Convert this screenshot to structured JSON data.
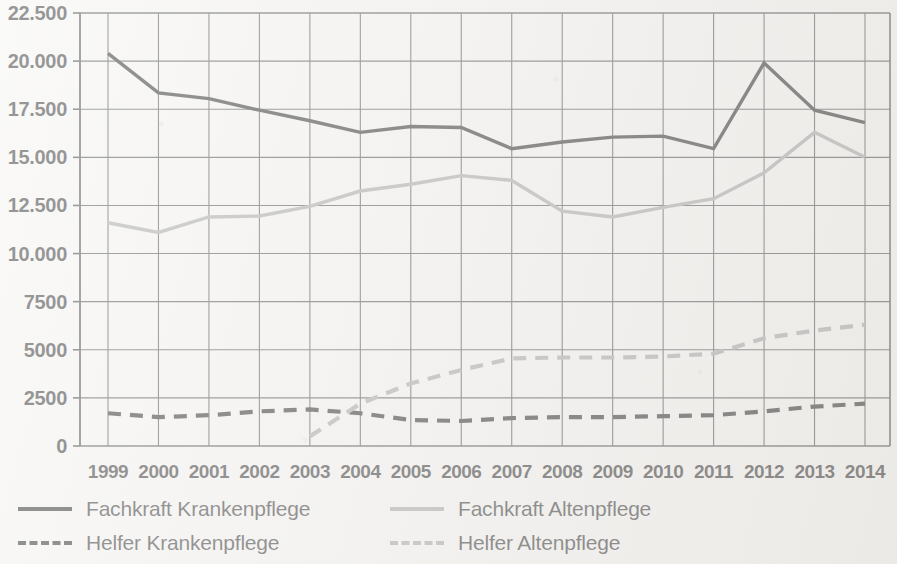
{
  "chart_data": {
    "type": "line",
    "title": "",
    "subtitle": "",
    "xlabel": "",
    "ylabel": "",
    "categories": [
      "1999",
      "2000",
      "2001",
      "2002",
      "2003",
      "2004",
      "2005",
      "2006",
      "2007",
      "2008",
      "2009",
      "2010",
      "2011",
      "2012",
      "2013",
      "2014"
    ],
    "x": [
      1999,
      2000,
      2001,
      2002,
      2003,
      2004,
      2005,
      2006,
      2007,
      2008,
      2009,
      2010,
      2011,
      2012,
      2013,
      2014
    ],
    "ylim": [
      0,
      22500
    ],
    "yticks": [
      0,
      2500,
      5000,
      7500,
      10000,
      12500,
      15000,
      17500,
      20000,
      22500
    ],
    "ytick_labels": [
      "0",
      "2500",
      "5000",
      "7500",
      "10.000",
      "12.500",
      "15.000",
      "17.500",
      "20.000",
      "22.500"
    ],
    "grid": true,
    "legend_position": "below",
    "series": [
      {
        "name": "Fachkraft Krankenpflege",
        "style": "solid",
        "color": "#121212",
        "values": [
          20400,
          18350,
          18050,
          17450,
          16900,
          16300,
          16600,
          16550,
          15450,
          15800,
          16050,
          16100,
          15450,
          19900,
          17450,
          16800
        ]
      },
      {
        "name": "Fachkraft Altenpflege",
        "style": "solid",
        "color": "#9b9b9b",
        "values": [
          11600,
          11100,
          11900,
          11950,
          12450,
          13250,
          13600,
          14050,
          13800,
          12200,
          11900,
          12400,
          12850,
          14200,
          16300,
          15000
        ]
      },
      {
        "name": "Helfer Krankenpflege",
        "style": "dashed",
        "color": "#121212",
        "values": [
          1700,
          1500,
          1600,
          1800,
          1900,
          1700,
          1350,
          1300,
          1450,
          1500,
          1500,
          1550,
          1600,
          1800,
          2050,
          2200
        ]
      },
      {
        "name": "Helfer Altenpflege",
        "style": "dashed",
        "color": "#9b9b9b",
        "values": [
          null,
          null,
          null,
          null,
          500,
          2200,
          3250,
          3950,
          4550,
          4600,
          4600,
          4650,
          4800,
          5600,
          6000,
          6300
        ]
      }
    ]
  },
  "legend": {
    "items": [
      {
        "label": "Fachkraft Krankenpflege",
        "style": "solid",
        "color": "#121212"
      },
      {
        "label": "Fachkraft Altenpflege",
        "style": "solid",
        "color": "#9b9b9b"
      },
      {
        "label": "Helfer Krankenpflege",
        "style": "dashed",
        "color": "#121212"
      },
      {
        "label": "Helfer Altenpflege",
        "style": "dashed",
        "color": "#9b9b9b"
      }
    ]
  },
  "colors": {
    "background": "#f4f3f1",
    "axis": "#2a2a2a",
    "grid": "#3a3a3a",
    "black_series": "#121212",
    "gray_series": "#9b9b9b"
  }
}
